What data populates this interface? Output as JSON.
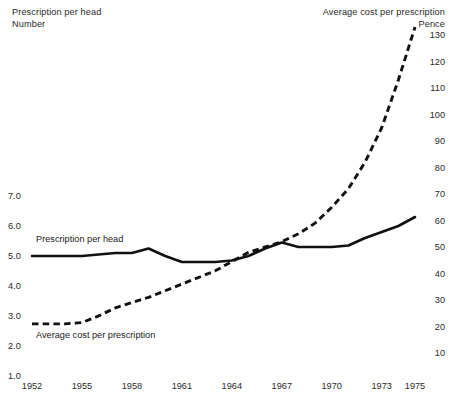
{
  "headers": {
    "left": "Prescription per head\nNumber",
    "right": "Average cost per prescription\nPence"
  },
  "series_labels": {
    "prescription": "Prescription per head",
    "avgcost": "Average cost per prescription"
  },
  "chart_data": {
    "type": "line",
    "title": "",
    "xlabel": "",
    "grid": false,
    "legend": "inline-annotations",
    "x": [
      1952,
      1953,
      1954,
      1955,
      1956,
      1957,
      1958,
      1959,
      1960,
      1961,
      1962,
      1963,
      1964,
      1965,
      1966,
      1967,
      1968,
      1969,
      1970,
      1971,
      1972,
      1973,
      1974,
      1975
    ],
    "xticks": [
      "1952",
      "1955",
      "1958",
      "1961",
      "1964",
      "1967",
      "1970",
      "1973",
      "1975"
    ],
    "xlim": [
      1952,
      1975.6
    ],
    "axes": [
      {
        "id": "left",
        "label": "Prescription per head",
        "unit": "Number",
        "ylim": [
          0.6,
          7.4
        ],
        "yticks": [
          "7.0",
          "6.0",
          "5.0",
          "4.0",
          "3.0",
          "2.0",
          "1.0"
        ],
        "ytick_values": [
          7.0,
          6.0,
          5.0,
          4.0,
          3.0,
          2.0,
          1.0
        ]
      },
      {
        "id": "right",
        "label": "Average cost per prescription",
        "unit": "Pence",
        "ylim": [
          2,
          138
        ],
        "yticks": [
          "130",
          "120",
          "110",
          "100",
          "90",
          "80",
          "70",
          "60",
          "50",
          "40",
          "30",
          "20",
          "10"
        ],
        "ytick_values": [
          130,
          120,
          110,
          100,
          90,
          80,
          70,
          60,
          50,
          40,
          30,
          20,
          10
        ]
      }
    ],
    "series": [
      {
        "name": "Prescription per head",
        "axis": "left",
        "style": "solid",
        "color": "#111111",
        "values": [
          5.0,
          5.0,
          5.0,
          5.0,
          5.05,
          5.1,
          5.1,
          5.25,
          5.0,
          4.8,
          4.8,
          4.8,
          4.85,
          5.0,
          5.25,
          5.45,
          5.3,
          5.3,
          5.3,
          5.35,
          5.6,
          5.8,
          6.0,
          6.3
        ]
      },
      {
        "name": "Average cost per prescription",
        "axis": "right",
        "style": "dashed",
        "color": "#111111",
        "values": [
          21,
          21,
          21,
          21.5,
          24,
          27,
          29,
          31,
          33.5,
          36,
          38.5,
          41,
          44.5,
          48,
          50,
          52,
          55,
          59,
          65,
          72,
          82,
          95,
          113,
          133
        ]
      }
    ]
  }
}
